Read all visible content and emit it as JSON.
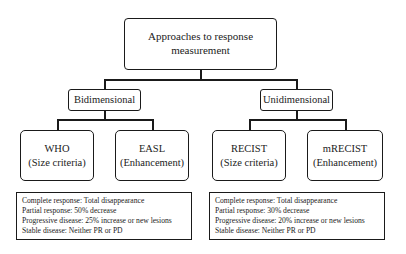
{
  "diagram": {
    "root": {
      "line1": "Approaches to response",
      "line2": "measurement"
    },
    "branches": [
      {
        "label": "Bidimensional",
        "children": [
          {
            "name": "WHO",
            "basis": "(Size criteria)"
          },
          {
            "name": "EASL",
            "basis": "(Enhancement)"
          }
        ],
        "criteria": [
          "Complete response: Total disappearance",
          "Partial response: 50% decrease",
          "Progressive disease: 25% increase or new lesions",
          "Stable disease: Neither PR or PD"
        ]
      },
      {
        "label": "Unidimensional",
        "children": [
          {
            "name": "RECIST",
            "basis": "(Size criteria)"
          },
          {
            "name": "mRECIST",
            "basis": "(Enhancement)"
          }
        ],
        "criteria": [
          "Complete response: Total disappearance",
          "Partial response: 30% decrease",
          "Progressive disease: 20% increase or new lesions",
          "Stable disease: Neither PR or PD"
        ]
      }
    ]
  }
}
